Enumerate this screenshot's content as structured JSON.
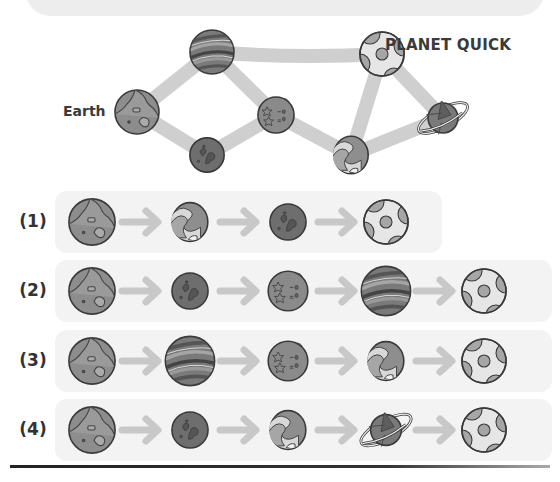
{
  "map": {
    "start_label": "Earth",
    "destination_label": "PLANET QUICK",
    "nodes": [
      {
        "id": "earth",
        "type": "earth",
        "x": 137,
        "y": 112
      },
      {
        "id": "striped",
        "type": "striped",
        "x": 212,
        "y": 52
      },
      {
        "id": "crater",
        "type": "crater",
        "x": 207,
        "y": 155
      },
      {
        "id": "stars",
        "type": "stars",
        "x": 276,
        "y": 115
      },
      {
        "id": "quick",
        "type": "quick",
        "x": 382,
        "y": 54
      },
      {
        "id": "swirl",
        "type": "swirl",
        "x": 351,
        "y": 155
      },
      {
        "id": "ringed",
        "type": "ringed",
        "x": 443,
        "y": 118
      }
    ],
    "paths": [
      [
        "earth",
        "striped"
      ],
      [
        "earth",
        "crater"
      ],
      [
        "striped",
        "stars"
      ],
      [
        "crater",
        "stars"
      ],
      [
        "striped",
        "quick"
      ],
      [
        "stars",
        "swirl"
      ],
      [
        "swirl",
        "quick"
      ],
      [
        "swirl",
        "ringed"
      ],
      [
        "quick",
        "ringed"
      ]
    ]
  },
  "options": [
    {
      "label": "(1)",
      "sequence": [
        "earth",
        "swirl",
        "crater",
        "quick"
      ]
    },
    {
      "label": "(2)",
      "sequence": [
        "earth",
        "crater",
        "stars",
        "striped",
        "quick"
      ]
    },
    {
      "label": "(3)",
      "sequence": [
        "earth",
        "striped",
        "stars",
        "swirl",
        "quick"
      ]
    },
    {
      "label": "(4)",
      "sequence": [
        "earth",
        "crater",
        "swirl",
        "ringed",
        "quick"
      ]
    }
  ],
  "icons": {
    "arrow": "right-arrow-icon",
    "planets": [
      "earth-planet-icon",
      "striped-planet-icon",
      "crater-planet-icon",
      "stars-planet-icon",
      "swirl-planet-icon",
      "ringed-planet-icon",
      "quick-planet-icon"
    ]
  },
  "colors": {
    "path": "#cfcfcf",
    "row_bg": "#f3f3f3",
    "arrow": "#c8c8c8",
    "outline": "#3a3a3a"
  }
}
